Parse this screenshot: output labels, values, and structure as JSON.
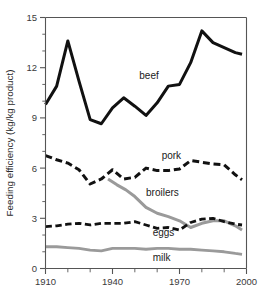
{
  "chart_data": {
    "type": "line",
    "title": "",
    "xlabel": "",
    "ylabel": "Feeding efficiency (kg/kg product)",
    "xlim": [
      1910,
      2000
    ],
    "ylim": [
      0,
      15
    ],
    "yticks": [
      0,
      3,
      6,
      9,
      12,
      15
    ],
    "ytick_labels": [
      "0",
      "3",
      "6",
      "9",
      "12",
      "15"
    ],
    "yminor_step": 1,
    "xticks": [
      1910,
      1920,
      1930,
      1940,
      1950,
      1960,
      1970,
      1980,
      1990,
      2000
    ],
    "xtick_labels": [
      "1910",
      "",
      "",
      "1940",
      "",
      "",
      "1970",
      "",
      "",
      "2000"
    ],
    "xtick_labels_shown": [
      "1910",
      "1940",
      "1970",
      "2000"
    ],
    "grid": false,
    "legend": "inline-labels",
    "series": [
      {
        "name": "beef",
        "color": "#111111",
        "style": "solid",
        "width": 3.0,
        "label_x": 1952,
        "label_y": 11.35,
        "x": [
          1910,
          1915,
          1920,
          1925,
          1930,
          1935,
          1940,
          1945,
          1950,
          1955,
          1960,
          1965,
          1970,
          1975,
          1980,
          1985,
          1990,
          1995,
          1998
        ],
        "y": [
          9.8,
          10.9,
          13.6,
          11.2,
          8.9,
          8.65,
          9.6,
          10.2,
          9.7,
          9.15,
          9.9,
          10.9,
          11.0,
          12.3,
          14.2,
          13.5,
          13.2,
          12.9,
          12.8
        ]
      },
      {
        "name": "pork",
        "color": "#111111",
        "style": "dashed",
        "width": 3.0,
        "label_x": 1962,
        "label_y": 6.55,
        "x": [
          1910,
          1915,
          1920,
          1925,
          1930,
          1935,
          1940,
          1945,
          1950,
          1955,
          1960,
          1965,
          1970,
          1975,
          1980,
          1985,
          1990,
          1995,
          1998
        ],
        "y": [
          6.75,
          6.5,
          6.3,
          5.9,
          5.05,
          5.35,
          5.9,
          5.35,
          5.45,
          6.0,
          5.85,
          5.85,
          5.95,
          6.45,
          6.35,
          6.25,
          6.2,
          5.6,
          5.3
        ]
      },
      {
        "name": "broilers",
        "color": "#9a9a9a",
        "style": "solid",
        "width": 3.0,
        "label_x": 1955,
        "label_y": 4.35,
        "x": [
          1938,
          1942,
          1946,
          1950,
          1955,
          1960,
          1965,
          1970,
          1975,
          1980,
          1985,
          1990,
          1995,
          1998
        ],
        "y": [
          5.35,
          5.0,
          4.7,
          4.3,
          3.65,
          3.3,
          3.1,
          2.85,
          2.45,
          2.7,
          2.85,
          2.85,
          2.55,
          2.3
        ]
      },
      {
        "name": "eggs",
        "color": "#111111",
        "style": "dashed",
        "width": 2.8,
        "label_x": 1958,
        "label_y": 1.95,
        "x": [
          1910,
          1915,
          1920,
          1925,
          1930,
          1935,
          1940,
          1945,
          1950,
          1955,
          1960,
          1965,
          1970,
          1975,
          1980,
          1985,
          1990,
          1995,
          1998
        ],
        "y": [
          2.5,
          2.55,
          2.65,
          2.7,
          2.6,
          2.7,
          2.7,
          2.7,
          2.8,
          2.6,
          2.4,
          2.45,
          2.3,
          2.75,
          2.95,
          3.0,
          2.8,
          2.65,
          2.6
        ]
      },
      {
        "name": "milk",
        "color": "#9a9a9a",
        "style": "solid",
        "width": 2.8,
        "label_x": 1958,
        "label_y": 0.45,
        "x": [
          1910,
          1915,
          1920,
          1925,
          1930,
          1935,
          1940,
          1945,
          1950,
          1955,
          1960,
          1965,
          1970,
          1975,
          1980,
          1985,
          1990,
          1995,
          1998
        ],
        "y": [
          1.3,
          1.3,
          1.25,
          1.2,
          1.1,
          1.05,
          1.2,
          1.2,
          1.2,
          1.15,
          1.2,
          1.2,
          1.15,
          1.15,
          1.1,
          1.05,
          1.0,
          0.9,
          0.85
        ]
      }
    ]
  }
}
